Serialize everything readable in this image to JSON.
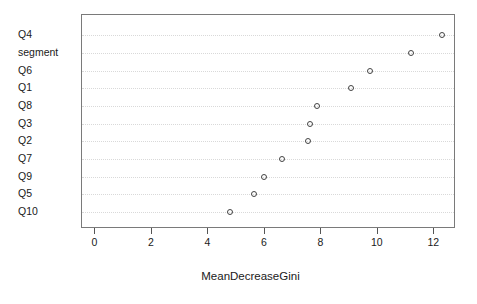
{
  "chart_data": {
    "type": "scatter",
    "title": "",
    "subtitle": "",
    "xlabel": "MeanDecreaseGini",
    "ylabel": "",
    "categories": [
      "Q4",
      "segment",
      "Q6",
      "Q1",
      "Q8",
      "Q3",
      "Q2",
      "Q7",
      "Q9",
      "Q5",
      "Q10"
    ],
    "values": [
      12.26,
      11.17,
      9.72,
      9.05,
      7.84,
      7.6,
      7.54,
      6.62,
      5.96,
      5.61,
      4.78
    ],
    "xlim": [
      -0.6,
      12.8
    ],
    "xticks": [
      0,
      2,
      4,
      6,
      8,
      10,
      12
    ],
    "xticklabels": [
      "0",
      "2",
      "4",
      "6",
      "8",
      "10",
      "12"
    ],
    "grid": true,
    "grid_axis": "y",
    "legend": false,
    "marker": "open-circle",
    "orientation": "horizontal",
    "sorted": "descending"
  },
  "axis": {
    "x_title": "MeanDecreaseGini"
  },
  "points": [
    {
      "label": "Q4",
      "value": 12.26
    },
    {
      "label": "segment",
      "value": 11.17
    },
    {
      "label": "Q6",
      "value": 9.72
    },
    {
      "label": "Q1",
      "value": 9.05
    },
    {
      "label": "Q8",
      "value": 7.84
    },
    {
      "label": "Q3",
      "value": 7.6
    },
    {
      "label": "Q2",
      "value": 7.54
    },
    {
      "label": "Q7",
      "value": 6.62
    },
    {
      "label": "Q9",
      "value": 5.96
    },
    {
      "label": "Q5",
      "value": 5.61
    },
    {
      "label": "Q10",
      "value": 4.78
    }
  ],
  "colors": {
    "background": "#ffffff",
    "panel_border": "#7a7a7a",
    "gridline": "#d9d9d9",
    "marker_stroke": "#444444",
    "text": "#1a1a1a",
    "tick": "#555555"
  }
}
